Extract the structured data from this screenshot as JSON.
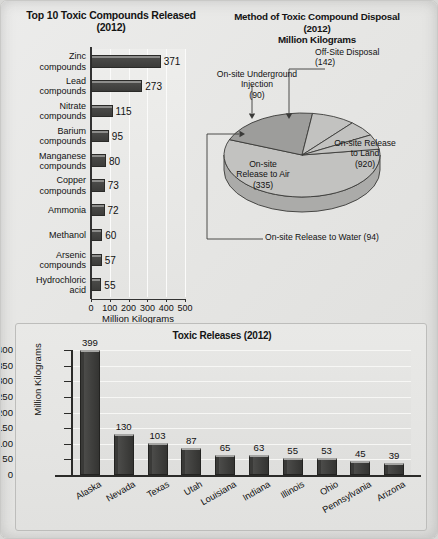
{
  "chart_data": [
    {
      "type": "bar",
      "orientation": "horizontal",
      "title": "Top 10 Toxic Compounds Released (2012)",
      "title_line1": "Top 10 Toxic Compounds Released",
      "title_line2": "(2012)",
      "xlabel": "Million Kilograms",
      "ylabel": "",
      "xlim": [
        0,
        500
      ],
      "xticks": [
        0,
        100,
        200,
        300,
        400,
        500
      ],
      "grid": true,
      "categories": [
        "Zinc compounds",
        "Lead compounds",
        "Nitrate compounds",
        "Barium compounds",
        "Manganese compounds",
        "Copper compounds",
        "Ammonia",
        "Methanol",
        "Arsenic compounds",
        "Hydrochloric acid"
      ],
      "category_lines": [
        [
          "Zinc",
          "compounds"
        ],
        [
          "Lead",
          "compounds"
        ],
        [
          "Nitrate",
          "compounds"
        ],
        [
          "Barium",
          "compounds"
        ],
        [
          "Manganese",
          "compounds"
        ],
        [
          "Copper",
          "compounds"
        ],
        [
          "Ammonia"
        ],
        [
          "Methanol"
        ],
        [
          "Arsenic",
          "compounds"
        ],
        [
          "Hydrochloric",
          "acid"
        ]
      ],
      "values": [
        371,
        273,
        115,
        95,
        80,
        73,
        72,
        60,
        57,
        55
      ]
    },
    {
      "type": "pie",
      "title_line1": "Method of Toxic Compound Disposal",
      "title_line2": "(2012)",
      "title_line3": "Million Kilograms",
      "units": "Million Kilograms",
      "total": 1581,
      "labels": [
        "On-site Release to Land",
        "On-site Release to Air",
        "Off-Site Disposal",
        "On-site Release to Water",
        "On-site Underground Injection"
      ],
      "values": [
        920,
        335,
        142,
        94,
        90
      ],
      "slices": [
        {
          "label": "On-site Release to Land",
          "label_lines": [
            "On-site Release",
            "to Land",
            "(920)"
          ],
          "value": 920
        },
        {
          "label": "On-site Release to Air",
          "label_lines": [
            "On-site",
            "Release to Air",
            "(335)"
          ],
          "value": 335
        },
        {
          "label": "Off-Site Disposal",
          "label_lines": [
            "Off-Site Disposal",
            "(142)"
          ],
          "value": 142
        },
        {
          "label": "On-site Release to Water",
          "label_lines": [
            "On-site Release to Water (94)"
          ],
          "value": 94
        },
        {
          "label": "On-site Underground Injection",
          "label_lines": [
            "On-site Underground",
            "Injection",
            "(90)"
          ],
          "value": 90
        }
      ]
    },
    {
      "type": "bar",
      "orientation": "vertical",
      "title": "Toxic Releases (2012)",
      "xlabel": "",
      "ylabel": "Million Kilograms",
      "ylim": [
        0,
        400
      ],
      "yticks": [
        0,
        50,
        100,
        150,
        200,
        250,
        300,
        350,
        400
      ],
      "grid": true,
      "categories": [
        "Alaska",
        "Nevada",
        "Texas",
        "Utah",
        "Louisiana",
        "Indiana",
        "Illinois",
        "Ohio",
        "Pennsylvania",
        "Arizona"
      ],
      "values": [
        399,
        130,
        103,
        87,
        65,
        63,
        55,
        53,
        45,
        39
      ]
    }
  ],
  "colors": {
    "page_background": "#e6e6e4",
    "bar_fill": "#3c3c3a",
    "bar_highlight": "#a6a6a4",
    "pie_light": "#bfbfbd",
    "pie_dark": "#9a9a98",
    "axis": "#2b2b29",
    "text": "#111111",
    "gridline": "#f7f7f5"
  }
}
